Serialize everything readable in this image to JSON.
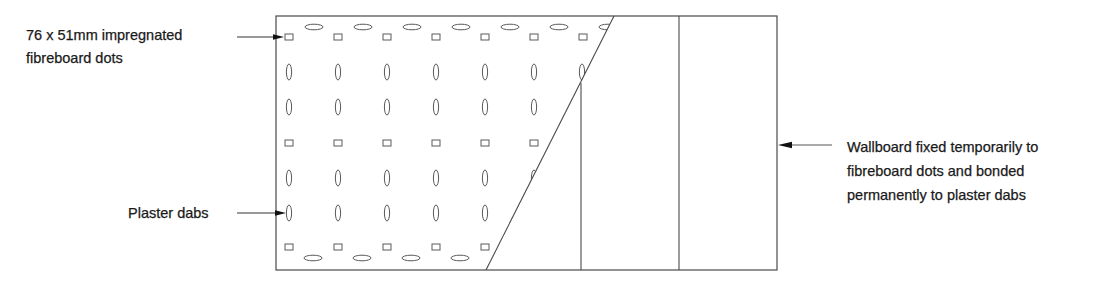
{
  "diagram": {
    "labels": {
      "fibreboard_dots": {
        "line1": "76 x 51mm impregnated",
        "line2": "fibreboard dots"
      },
      "plaster_dabs": {
        "line1": "Plaster dabs"
      },
      "wallboard": {
        "line1": "Wallboard fixed temporarily to",
        "line2": "fibreboard dots and bonded",
        "line3": "permanently to plaster dabs"
      }
    },
    "components": [
      {
        "name": "wall",
        "shape": "rectangle"
      },
      {
        "name": "fibreboard-dots",
        "shape": "small-rectangles",
        "rows": [
          "top",
          "middle",
          "bottom"
        ]
      },
      {
        "name": "plaster-dabs",
        "shape": "vertical-ellipses",
        "rows": 4
      },
      {
        "name": "horizontal-dabs",
        "shape": "horizontal-ellipses",
        "rows": [
          "top",
          "bottom"
        ]
      },
      {
        "name": "wallboard-sheets",
        "count": 3,
        "note": "first sheet shown partially cut away diagonally"
      }
    ],
    "colors": {
      "line": "#4a4a4a",
      "text": "#1a1a1a",
      "background": "#ffffff"
    }
  }
}
